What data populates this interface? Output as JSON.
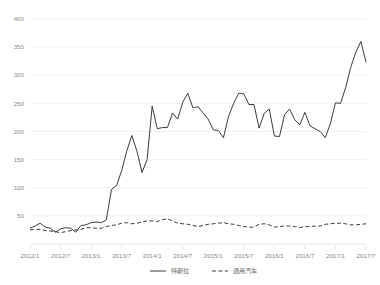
{
  "chart_data": {
    "type": "line",
    "title": "",
    "subtitle": "",
    "xlabel": "",
    "ylabel": "",
    "ylim": [
      0,
      400
    ],
    "yticks": [
      0,
      50,
      100,
      150,
      200,
      250,
      300,
      350,
      400
    ],
    "ytick_labels": [
      "",
      "50",
      "100",
      "150",
      "200",
      "250",
      "300",
      "350",
      "400"
    ],
    "grid": true,
    "grid_axis": "y",
    "legend_position": "bottom-center",
    "x": [
      "2012/1",
      "2012/2",
      "2012/3",
      "2012/4",
      "2012/5",
      "2012/6",
      "2012/7",
      "2012/8",
      "2012/9",
      "2012/10",
      "2012/11",
      "2012/12",
      "2013/1",
      "2013/2",
      "2013/3",
      "2013/4",
      "2013/5",
      "2013/6",
      "2013/7",
      "2013/8",
      "2013/9",
      "2013/10",
      "2013/11",
      "2013/12",
      "2014/1",
      "2014/2",
      "2014/3",
      "2014/4",
      "2014/5",
      "2014/6",
      "2014/7",
      "2014/8",
      "2014/9",
      "2014/10",
      "2014/11",
      "2014/12",
      "2015/1",
      "2015/2",
      "2015/3",
      "2015/4",
      "2015/5",
      "2015/6",
      "2015/7",
      "2015/8",
      "2015/9",
      "2015/10",
      "2015/11",
      "2015/12",
      "2016/1",
      "2016/2",
      "2016/3",
      "2016/4",
      "2016/5",
      "2016/6",
      "2016/7",
      "2016/8",
      "2016/9",
      "2016/10",
      "2016/11",
      "2016/12",
      "2017/1",
      "2017/2",
      "2017/3",
      "2017/4",
      "2017/5",
      "2017/6",
      "2017/7"
    ],
    "xtick_labels": [
      "2012/1",
      "2012/7",
      "2013/1",
      "2013/7",
      "2014/1",
      "2014/7",
      "2015/1",
      "2015/7",
      "2016/1",
      "2016/7",
      "2017/1",
      "2017/7"
    ],
    "xtick_indices": [
      0,
      6,
      12,
      18,
      24,
      30,
      36,
      42,
      48,
      54,
      60,
      66
    ],
    "series": [
      {
        "name": "特斯拉",
        "style": "solid",
        "color": "#3c3c3c",
        "values": [
          28,
          32,
          37,
          30,
          28,
          21,
          27,
          29,
          28,
          21,
          33,
          34,
          38,
          39,
          38,
          43,
          97,
          104,
          130,
          165,
          193,
          165,
          127,
          150,
          245,
          205,
          207,
          207,
          233,
          222,
          252,
          268,
          242,
          244,
          233,
          222,
          203,
          202,
          189,
          227,
          250,
          268,
          267,
          248,
          248,
          206,
          232,
          240,
          192,
          191,
          230,
          240,
          221,
          212,
          234,
          210,
          205,
          200,
          189,
          214,
          251,
          250,
          278,
          314,
          341,
          360,
          323
        ]
      },
      {
        "name": "通用汽车",
        "style": "dashed",
        "color": "#3c3c3c",
        "values": [
          25,
          26,
          26,
          24,
          23,
          22,
          20,
          22,
          24,
          25,
          26,
          29,
          29,
          28,
          28,
          31,
          33,
          34,
          37,
          38,
          36,
          37,
          39,
          41,
          41,
          40,
          43,
          45,
          41,
          37,
          36,
          35,
          33,
          31,
          33,
          35,
          36,
          37,
          38,
          36,
          35,
          33,
          31,
          30,
          30,
          35,
          36,
          34,
          30,
          31,
          32,
          32,
          31,
          29,
          31,
          31,
          32,
          32,
          35,
          36,
          37,
          37,
          36,
          34,
          34,
          35,
          36
        ]
      }
    ],
    "legend": [
      {
        "label": "特斯拉",
        "style": "solid"
      },
      {
        "label": "通用汽车",
        "style": "dashed"
      }
    ]
  }
}
